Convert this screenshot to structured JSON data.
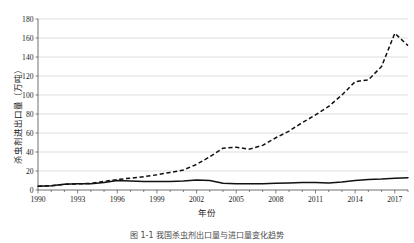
{
  "chart_data": {
    "type": "line",
    "title": "",
    "xlabel": "年份",
    "ylabel": "杀虫剂进出口量（万吨）",
    "xlim": [
      1990,
      2018
    ],
    "ylim": [
      0,
      180
    ],
    "ytick_values": [
      0,
      20,
      40,
      60,
      80,
      100,
      120,
      140,
      160,
      180
    ],
    "ytick_labels": [
      "0",
      "20",
      "40",
      "60",
      "80",
      "100",
      "120",
      "140",
      "160",
      "180"
    ],
    "xtick_labels": [
      "1990",
      "1993",
      "1996",
      "1999",
      "2002",
      "2005",
      "2008",
      "2011",
      "2014",
      "2017"
    ],
    "xtick_values": [
      1990,
      1993,
      1996,
      1999,
      2002,
      2005,
      2008,
      2011,
      2014,
      2017
    ],
    "x": [
      1990,
      1991,
      1992,
      1993,
      1994,
      1995,
      1996,
      1997,
      1998,
      1999,
      2000,
      2001,
      2002,
      2003,
      2004,
      2005,
      2006,
      2007,
      2008,
      2009,
      2010,
      2011,
      2012,
      2013,
      2014,
      2015,
      2016,
      2017,
      2018
    ],
    "grid": "horizontal",
    "legend": "none",
    "series": [
      {
        "name": "出口量",
        "style": "dashed",
        "color": "#111111",
        "values": [
          4,
          4.5,
          6,
          6.5,
          7,
          9,
          11,
          12.5,
          14,
          16,
          18.5,
          21,
          27,
          35,
          44,
          45,
          43,
          47,
          55,
          62,
          71,
          79,
          88,
          100,
          114,
          116,
          130,
          165,
          152
        ]
      },
      {
        "name": "进口量",
        "style": "solid",
        "color": "#111111",
        "values": [
          4,
          4.5,
          6,
          6.5,
          6.5,
          8,
          10,
          9.5,
          9,
          9,
          9,
          9.5,
          10.5,
          10,
          7,
          6.5,
          6.5,
          6.5,
          7,
          7.5,
          8,
          8,
          7.5,
          8.5,
          10,
          11,
          11.5,
          12.5,
          13
        ]
      }
    ]
  },
  "caption": "图 1-1 我国杀虫剂出口量与进口量变化趋势"
}
